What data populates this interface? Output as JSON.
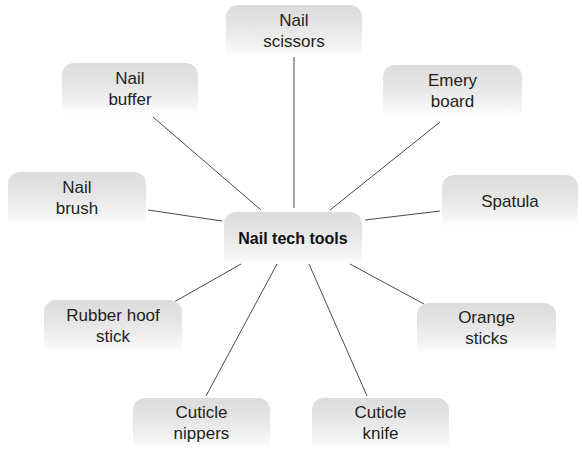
{
  "diagram": {
    "type": "mind-map",
    "center": {
      "label": "Nail tech tools"
    },
    "nodes": [
      {
        "id": "scissors",
        "label": "Nail\nscissors"
      },
      {
        "id": "buffer",
        "label": "Nail\nbuffer"
      },
      {
        "id": "emery",
        "label": "Emery\nboard"
      },
      {
        "id": "brush",
        "label": "Nail\nbrush"
      },
      {
        "id": "spatula",
        "label": "Spatula"
      },
      {
        "id": "rubber",
        "label": "Rubber hoof\nstick"
      },
      {
        "id": "orange",
        "label": "Orange\nsticks"
      },
      {
        "id": "nippers",
        "label": "Cuticle\nnippers"
      },
      {
        "id": "knife",
        "label": "Cuticle\nknife"
      }
    ],
    "colors": {
      "box_fill": "#e2e2e2",
      "line": "#4a4a4a",
      "text": "#231f20"
    }
  }
}
